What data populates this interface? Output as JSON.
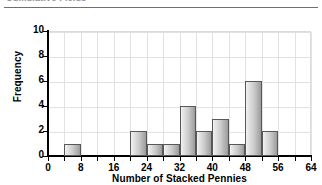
{
  "header": {
    "clipped_title": "Cumulative Fields",
    "rule": "divider"
  },
  "chart_data": {
    "type": "bar",
    "subtype": "histogram",
    "title": "",
    "xlabel": "Number of Stacked Pennies",
    "ylabel": "Frequency",
    "xlim": [
      0,
      64
    ],
    "ylim": [
      0,
      10
    ],
    "bin_width": 4,
    "grid": true,
    "legend": null,
    "x_tick_labels": [
      "0",
      "8",
      "16",
      "24",
      "32",
      "40",
      "48",
      "56",
      "64"
    ],
    "x_tick_values": [
      0,
      8,
      16,
      24,
      32,
      40,
      48,
      56,
      64
    ],
    "x_minor_tick_values": [
      0,
      4,
      8,
      12,
      16,
      20,
      24,
      28,
      32,
      36,
      40,
      44,
      48,
      52,
      56,
      60,
      64
    ],
    "y_tick_labels": [
      "0",
      "2",
      "4",
      "6",
      "8",
      "10"
    ],
    "y_tick_values": [
      0,
      2,
      4,
      6,
      8,
      10
    ],
    "bins": [
      {
        "start": 0,
        "end": 4,
        "value": 0
      },
      {
        "start": 4,
        "end": 8,
        "value": 1
      },
      {
        "start": 8,
        "end": 12,
        "value": 0
      },
      {
        "start": 12,
        "end": 16,
        "value": 0
      },
      {
        "start": 16,
        "end": 20,
        "value": 0
      },
      {
        "start": 20,
        "end": 24,
        "value": 2
      },
      {
        "start": 24,
        "end": 28,
        "value": 1
      },
      {
        "start": 28,
        "end": 32,
        "value": 1
      },
      {
        "start": 32,
        "end": 36,
        "value": 4
      },
      {
        "start": 36,
        "end": 40,
        "value": 2
      },
      {
        "start": 40,
        "end": 44,
        "value": 3
      },
      {
        "start": 44,
        "end": 48,
        "value": 1
      },
      {
        "start": 48,
        "end": 52,
        "value": 6
      },
      {
        "start": 52,
        "end": 56,
        "value": 2
      },
      {
        "start": 56,
        "end": 60,
        "value": 0
      },
      {
        "start": 60,
        "end": 64,
        "value": 0
      }
    ],
    "categories": [
      "0-4",
      "4-8",
      "8-12",
      "12-16",
      "16-20",
      "20-24",
      "24-28",
      "28-32",
      "32-36",
      "36-40",
      "40-44",
      "44-48",
      "48-52",
      "52-56",
      "56-60",
      "60-64"
    ],
    "values": [
      0,
      1,
      0,
      0,
      0,
      2,
      1,
      1,
      4,
      2,
      3,
      1,
      6,
      2,
      0,
      0
    ],
    "colors": {
      "bar_fill_light": "#f2f2f2",
      "bar_fill_dark": "#9a9a9a",
      "bar_outline": "#585858",
      "gridline": "#e2e2e2",
      "axis": "#000000",
      "text": "#000000",
      "header_text": "#8d8f92",
      "header_rule": "#6d7073"
    }
  }
}
